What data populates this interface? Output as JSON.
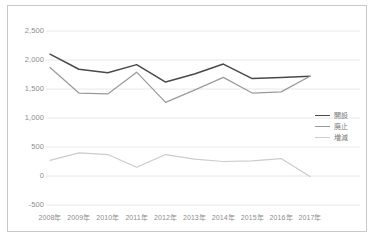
{
  "chart_data": {
    "type": "line",
    "title": "",
    "subtitle": "",
    "xlabel": "",
    "ylabel": "",
    "categories": [
      "2008年",
      "2009年",
      "2010年",
      "2011年",
      "2012年",
      "2013年",
      "2014年",
      "2015年",
      "2016年",
      "2017年"
    ],
    "ylim": [
      -500,
      2500
    ],
    "ytick_values": [
      2500,
      2000,
      1500,
      1000,
      500,
      0,
      -500
    ],
    "ytick_labels": [
      "2,500",
      "2,000",
      "1,500",
      "1,000",
      "500",
      "0",
      "-500"
    ],
    "grid": true,
    "grid_axis": "y",
    "legend_position": "right",
    "series": [
      {
        "name": "開設",
        "color": "#4a4a4a",
        "values": [
          2100,
          1840,
          1780,
          1920,
          1620,
          1760,
          1930,
          1680,
          1700,
          1720
        ]
      },
      {
        "name": "廃止",
        "color": "#9a9a9a",
        "values": [
          1870,
          1430,
          1415,
          1790,
          1270,
          1480,
          1700,
          1430,
          1450,
          1720
        ]
      },
      {
        "name": "増減",
        "color": "#cccccc",
        "values": [
          270,
          400,
          370,
          150,
          370,
          290,
          250,
          260,
          300,
          -10
        ]
      }
    ]
  },
  "axes": {
    "y_labels": [
      "2,500",
      "2,000",
      "1,500",
      "1,000",
      "500",
      "0",
      "-500"
    ],
    "x_labels": [
      "2008年",
      "2009年",
      "2010年",
      "2011年",
      "2012年",
      "2013年",
      "2014年",
      "2015年",
      "2016年",
      "2017年"
    ]
  },
  "legend": {
    "items": [
      {
        "label": "開設",
        "color": "#4a4a4a"
      },
      {
        "label": "廃止",
        "color": "#9a9a9a"
      },
      {
        "label": "増減",
        "color": "#cccccc"
      }
    ]
  },
  "colors": {
    "background": "#ffffff",
    "frame": "#c9c9c9",
    "gridline": "#e8e8e8",
    "tick_text": "#8d8d8d",
    "legend_text": "#7a7a7a"
  }
}
